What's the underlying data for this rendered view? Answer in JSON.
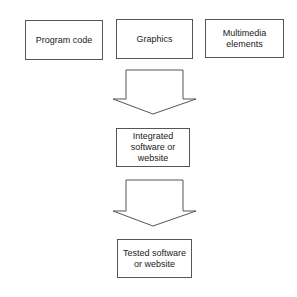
{
  "diagram": {
    "inputs": [
      {
        "label": "Program code"
      },
      {
        "label": "Graphics"
      },
      {
        "label": "Multimedia elements"
      }
    ],
    "integrated": {
      "label": "Integrated software or website"
    },
    "tested": {
      "label": "Tested software or website"
    },
    "arrows": [
      {
        "from": "inputs",
        "to": "integrated",
        "icon": "block-down-arrow-icon"
      },
      {
        "from": "integrated",
        "to": "tested",
        "icon": "block-down-arrow-icon"
      }
    ],
    "colors": {
      "stroke": "#555555",
      "fill": "#ffffff",
      "text": "#222222"
    }
  }
}
